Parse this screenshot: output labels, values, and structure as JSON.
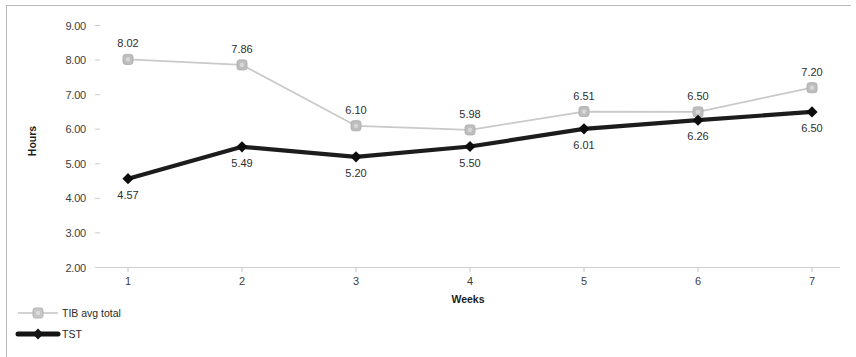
{
  "chart_data": {
    "type": "line",
    "title": "",
    "xlabel": "Weeks",
    "ylabel": "Hours",
    "categories": [
      "1",
      "2",
      "3",
      "4",
      "5",
      "6",
      "7"
    ],
    "x": [
      1,
      2,
      3,
      4,
      5,
      6,
      7
    ],
    "ylim": [
      2.0,
      9.0
    ],
    "ytick_labels": [
      "9.00",
      "8.00",
      "7.00",
      "6.00",
      "5.00",
      "4.00",
      "3.00",
      "2.00"
    ],
    "ytick_values": [
      9.0,
      8.0,
      7.0,
      6.0,
      5.0,
      4.0,
      3.0,
      2.0
    ],
    "grid": false,
    "legend_position": "bottom-left",
    "series": [
      {
        "name": "TIB avg total",
        "color": "#c9c9c9",
        "marker": "rounded-square",
        "marker_color": "#bdbdbd",
        "label_position": "above",
        "values": [
          8.02,
          7.86,
          6.1,
          5.98,
          6.51,
          6.5,
          7.2
        ],
        "labels": [
          "8.02",
          "7.86",
          "6.10",
          "5.98",
          "6.51",
          "6.50",
          "7.20"
        ]
      },
      {
        "name": "TST",
        "color": "#1c1c1c",
        "marker": "diamond",
        "marker_color": "#111111",
        "label_position": "below",
        "values": [
          4.57,
          5.49,
          5.2,
          5.5,
          6.01,
          6.26,
          6.5
        ],
        "labels": [
          "4.57",
          "5.49",
          "5.20",
          "5.50",
          "6.01",
          "6.26",
          "6.50"
        ]
      }
    ]
  },
  "legend": {
    "items": [
      {
        "label": "TIB avg total",
        "marker": "square-marker",
        "color": "#c3c3c3"
      },
      {
        "label": "TST",
        "marker": "diamond-marker",
        "color": "#141414"
      }
    ]
  },
  "axes": {
    "y_title": "Hours",
    "x_title": "Weeks"
  }
}
